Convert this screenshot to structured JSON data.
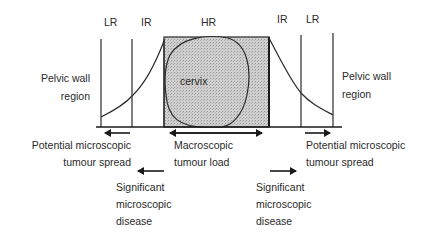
{
  "zones": {
    "left_lr": "LR",
    "left_ir": "IR",
    "hr": "HR",
    "right_ir": "IR",
    "right_lr": "LR"
  },
  "labels": {
    "pelvic_wall_left_line1": "Pelvic wall",
    "pelvic_wall_left_line2": "region",
    "pelvic_wall_right_line1": "Pelvic wall",
    "pelvic_wall_right_line2": "region",
    "cervix": "cervix",
    "macroscopic_line1": "Macroscopic",
    "macroscopic_line2": "tumour load",
    "potential_left_line1": "Potential microscopic",
    "potential_left_line2": "tumour spread",
    "potential_right_line1": "Potential microscopic",
    "potential_right_line2": "tumour spread",
    "significant_left_line1": "Significant",
    "significant_left_line2": "microscopic",
    "significant_left_line3": "disease",
    "significant_right_line1": "Significant",
    "significant_right_line2": "microscopic",
    "significant_right_line3": "disease"
  },
  "colors": {
    "line": "#2a2a2a",
    "fill": "#c8c8c8"
  }
}
